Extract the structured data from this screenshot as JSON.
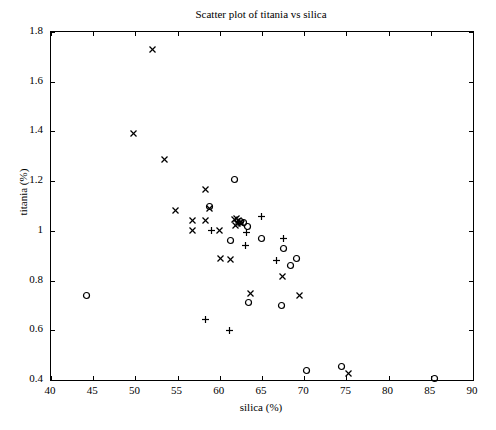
{
  "chart_data": {
    "type": "scatter",
    "title": "Scatter plot of titania vs silica",
    "xlabel": "silica (%)",
    "ylabel": "titania (%)",
    "xlim": [
      40,
      90
    ],
    "ylim": [
      0.4,
      1.8
    ],
    "xticks": [
      40,
      45,
      50,
      55,
      60,
      65,
      70,
      75,
      80,
      85,
      90
    ],
    "xtick_labels": [
      "40",
      "45",
      "50",
      "55",
      "60",
      "65",
      "70",
      "75",
      "80",
      "85",
      "90"
    ],
    "yticks": [
      0.4,
      0.6,
      0.8,
      1.0,
      1.2,
      1.4,
      1.6,
      1.8
    ],
    "ytick_labels": [
      "0.4",
      "0.6",
      "0.8",
      "1",
      "1.2",
      "1.4",
      "1.6",
      "1.8"
    ],
    "grid": false,
    "legend": null,
    "marker_color": "#000000",
    "series": [
      {
        "name": "x-marker",
        "marker": "x",
        "points": [
          [
            52.0,
            1.73
          ],
          [
            49.8,
            1.39
          ],
          [
            53.5,
            1.288
          ],
          [
            58.3,
            1.168
          ],
          [
            54.7,
            1.08
          ],
          [
            58.8,
            1.09
          ],
          [
            56.8,
            1.04
          ],
          [
            58.3,
            1.04
          ],
          [
            56.8,
            1.0
          ],
          [
            60.0,
            1.0
          ],
          [
            61.7,
            1.045
          ],
          [
            62.0,
            1.05
          ],
          [
            62.2,
            1.042
          ],
          [
            62.4,
            1.035
          ],
          [
            62.1,
            1.03
          ],
          [
            62.6,
            1.028
          ],
          [
            61.9,
            1.022
          ],
          [
            60.1,
            0.888
          ],
          [
            61.3,
            0.885
          ],
          [
            63.6,
            0.748
          ],
          [
            67.4,
            0.818
          ],
          [
            69.5,
            0.738
          ],
          [
            75.2,
            0.425
          ]
        ]
      },
      {
        "name": "circle-marker",
        "marker": "o",
        "points": [
          [
            44.2,
            0.74
          ],
          [
            61.7,
            1.205
          ],
          [
            58.8,
            1.098
          ],
          [
            62.5,
            1.038
          ],
          [
            62.8,
            1.032
          ],
          [
            63.3,
            1.018
          ],
          [
            61.3,
            0.962
          ],
          [
            64.9,
            0.968
          ],
          [
            67.5,
            0.93
          ],
          [
            68.4,
            0.862
          ],
          [
            69.1,
            0.888
          ],
          [
            63.4,
            0.71
          ],
          [
            67.3,
            0.698
          ],
          [
            70.3,
            0.438
          ],
          [
            74.4,
            0.455
          ],
          [
            85.4,
            0.405
          ]
        ]
      },
      {
        "name": "plus-marker",
        "marker": "+",
        "points": [
          [
            59.0,
            1.0
          ],
          [
            63.2,
            0.995
          ],
          [
            64.9,
            1.058
          ],
          [
            63.0,
            0.94
          ],
          [
            67.5,
            0.968
          ],
          [
            66.7,
            0.88
          ],
          [
            58.3,
            0.645
          ],
          [
            61.2,
            0.6
          ]
        ]
      }
    ]
  }
}
